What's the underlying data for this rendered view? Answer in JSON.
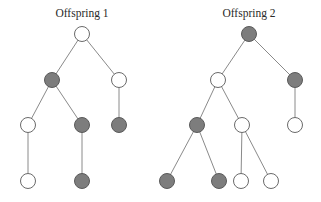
{
  "diagram": {
    "radius": 7.5,
    "colors": {
      "filled": "#7d7d7d",
      "empty": "#ffffff",
      "edge": "#8a8a8a"
    },
    "trees": [
      {
        "title": "Offspring 1",
        "title_pos": [
          82,
          17
        ],
        "nodes": [
          {
            "id": "a",
            "x": 82,
            "y": 34,
            "filled": false
          },
          {
            "id": "b",
            "x": 52,
            "y": 80,
            "filled": true
          },
          {
            "id": "c",
            "x": 119,
            "y": 80,
            "filled": false
          },
          {
            "id": "d",
            "x": 28,
            "y": 125,
            "filled": false
          },
          {
            "id": "e",
            "x": 82,
            "y": 125,
            "filled": true
          },
          {
            "id": "f",
            "x": 119,
            "y": 125,
            "filled": true
          },
          {
            "id": "g",
            "x": 28,
            "y": 181,
            "filled": false
          },
          {
            "id": "h",
            "x": 82,
            "y": 181,
            "filled": true
          }
        ],
        "edges": [
          [
            "a",
            "b"
          ],
          [
            "a",
            "c"
          ],
          [
            "b",
            "d"
          ],
          [
            "b",
            "e"
          ],
          [
            "c",
            "f"
          ],
          [
            "d",
            "g"
          ],
          [
            "e",
            "h"
          ]
        ]
      },
      {
        "title": "Offspring 2",
        "title_pos": [
          249,
          17
        ],
        "nodes": [
          {
            "id": "a",
            "x": 249,
            "y": 34,
            "filled": true
          },
          {
            "id": "b",
            "x": 218,
            "y": 80,
            "filled": false
          },
          {
            "id": "c",
            "x": 295,
            "y": 80,
            "filled": true
          },
          {
            "id": "d",
            "x": 197,
            "y": 125,
            "filled": true
          },
          {
            "id": "e",
            "x": 242,
            "y": 125,
            "filled": false
          },
          {
            "id": "f",
            "x": 295,
            "y": 125,
            "filled": false
          },
          {
            "id": "g",
            "x": 167,
            "y": 181,
            "filled": true
          },
          {
            "id": "h",
            "x": 219,
            "y": 181,
            "filled": true
          },
          {
            "id": "i",
            "x": 241,
            "y": 181,
            "filled": false
          },
          {
            "id": "j",
            "x": 271,
            "y": 181,
            "filled": false
          }
        ],
        "edges": [
          [
            "a",
            "b"
          ],
          [
            "a",
            "c"
          ],
          [
            "b",
            "d"
          ],
          [
            "b",
            "e"
          ],
          [
            "c",
            "f"
          ],
          [
            "d",
            "g"
          ],
          [
            "d",
            "h"
          ],
          [
            "e",
            "i"
          ],
          [
            "e",
            "j"
          ]
        ]
      }
    ]
  }
}
